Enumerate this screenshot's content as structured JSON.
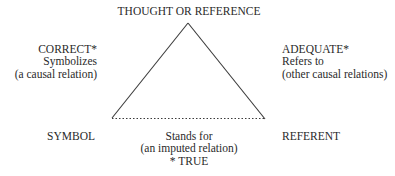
{
  "diagram": {
    "type": "semiotic-triangle",
    "apex": {
      "label": "THOUGHT OR REFERENCE"
    },
    "left_side": {
      "lines": [
        "CORRECT*",
        "Symbolizes",
        "(a causal relation)"
      ]
    },
    "right_side": {
      "lines": [
        "ADEQUATE*",
        "Refers to",
        "(other causal relations)"
      ]
    },
    "bottom_left": {
      "label": "SYMBOL"
    },
    "bottom_right": {
      "label": "REFERENT"
    },
    "base": {
      "lines": [
        "Stands for",
        "(an imputed relation)",
        "* TRUE"
      ],
      "style": "dotted"
    },
    "colors": {
      "line": "#3a3a3a",
      "text": "#2a2a2a",
      "background": "#ffffff"
    }
  }
}
